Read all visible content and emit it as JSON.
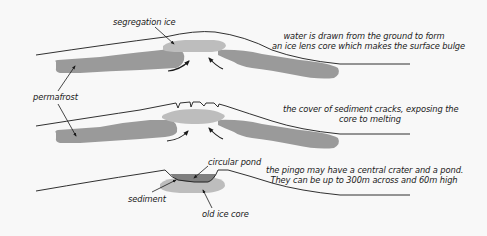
{
  "colors": {
    "background": "#f8f8f8",
    "permafrost": "#9a9a9a",
    "ice_core": "#bdbdbd",
    "pond": "#7f7f7f",
    "ground_line": "#1a1a1a",
    "text": "#1a1a1a"
  },
  "stages": [
    {
      "id": "stage-1",
      "caption_line1": "water is drawn from the ground to form",
      "caption_line2": "an ice lens core which makes the surface bulge"
    },
    {
      "id": "stage-2",
      "caption_line1": "the cover of sediment cracks, exposing the",
      "caption_line2": "core to melting"
    },
    {
      "id": "stage-3",
      "caption_line1": "the pingo may have a central crater and a pond.",
      "caption_line2": "They can be up to 300m across and 60m high"
    }
  ],
  "labels": {
    "segregation_ice": "segregation ice",
    "permafrost": "permafrost",
    "circular_pond": "circular pond",
    "sediment": "sediment",
    "old_ice_core": "old ice core"
  }
}
